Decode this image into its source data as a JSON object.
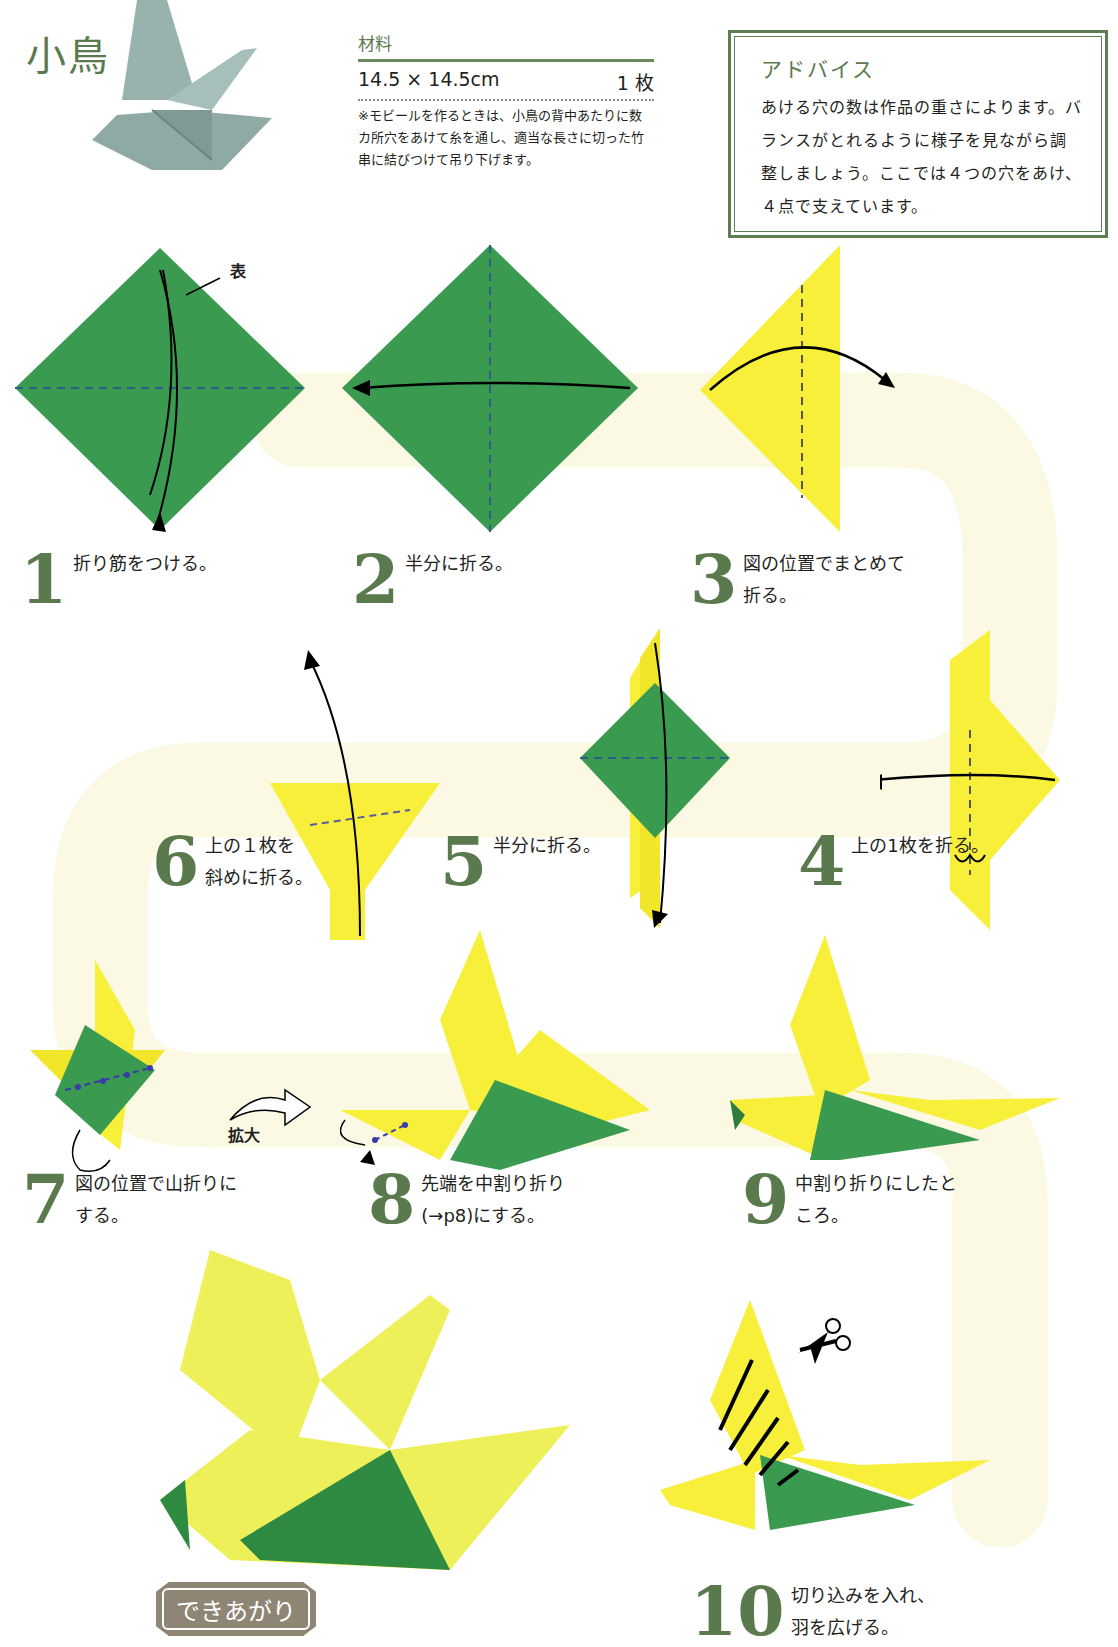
{
  "header": {
    "title": "小鳥"
  },
  "materials": {
    "heading": "材料",
    "paper_size": "14.5 × 14.5cm",
    "quantity": "1 枚",
    "note": "※モビールを作るときは、小鳥の背中あたりに数カ所穴をあけて糸を通し、適当な長さに切った竹串に結びつけて吊り下げます。"
  },
  "advice": {
    "heading": "アドバイス",
    "body": "あける穴の数は作品の重さによります。バランスがとれるように様子を見ながら調整しましょう。ここでは４つの穴をあけ、４点で支えています。"
  },
  "labels": {
    "front_side": "表",
    "enlarge": "拡大",
    "finished": "できあがり"
  },
  "steps": [
    {
      "number": "1",
      "text": "折り筋をつける。"
    },
    {
      "number": "2",
      "text": "半分に折る。"
    },
    {
      "number": "3",
      "text": "図の位置でまとめて\n折る。"
    },
    {
      "number": "4",
      "text": "上の1枚を折る。"
    },
    {
      "number": "5",
      "text": "半分に折る。"
    },
    {
      "number": "6",
      "text": "上の１枚を\n斜めに折る。"
    },
    {
      "number": "7",
      "text": "図の位置で山折りに\nする。"
    },
    {
      "number": "8",
      "text": "先端を中割り折り\n(→p8)にする。"
    },
    {
      "number": "9",
      "text": "中割り折りにしたと\nころ。"
    },
    {
      "number": "10",
      "text": "切り込みを入れ、\n羽を広げる。"
    }
  ],
  "colors": {
    "paper_front": "#3a9a4f",
    "paper_back": "#f7ef3a",
    "accent_green": "#5a7a4e",
    "fold_line": "#2d5d8a",
    "path_bg": "#fbf9e4",
    "badge": "#8f8574",
    "sample_bird": "#98b3ae"
  }
}
